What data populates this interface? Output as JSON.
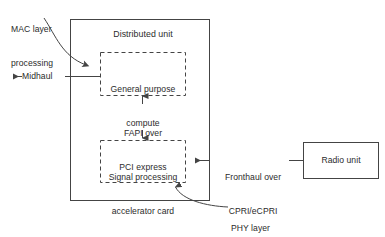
{
  "diagram": {
    "colors": {
      "line": "#444444",
      "text": "#2b2b2b",
      "background": "#ffffff"
    },
    "outer_box": {
      "label": "Distributed unit"
    },
    "inner_boxes": [
      {
        "id": "gpc",
        "line1": "General purpose",
        "line2": "compute"
      },
      {
        "id": "spac",
        "line1": "Signal processing",
        "line2": "accelerator card"
      }
    ],
    "external_boxes": [
      {
        "id": "radio",
        "label": "Radio unit"
      }
    ],
    "callouts": [
      {
        "id": "mac",
        "line1": "MAC layer",
        "line2": "processing"
      },
      {
        "id": "phy",
        "line1": "PHY layer",
        "line2": "processing"
      }
    ],
    "link_labels": [
      {
        "id": "midhaul",
        "text": "Midhaul"
      },
      {
        "id": "fapi",
        "line1": "FAPI over",
        "line2": "PCI express"
      },
      {
        "id": "fronthaul",
        "line1": "Fronthaul over",
        "line2": "CPRI/eCPRI"
      }
    ]
  }
}
